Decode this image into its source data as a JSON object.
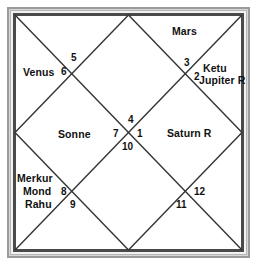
{
  "chart": {
    "type": "north-indian-vedic-chart",
    "title": "",
    "style": {
      "line_color": "#333333",
      "frame_color": "#4a4a4a",
      "background": "#ffffff",
      "text_color": "#111111"
    },
    "houses": [
      {
        "number": "1",
        "position": "center-right",
        "planets": []
      },
      {
        "number": "2",
        "position": "upper-right-inner",
        "planets": [
          "Ketu",
          "Jupiter R"
        ]
      },
      {
        "number": "3",
        "position": "upper-right-corner",
        "planets": []
      },
      {
        "number": "4",
        "position": "center-top",
        "planets": []
      },
      {
        "number": "5",
        "position": "upper-left-corner",
        "planets": []
      },
      {
        "number": "6",
        "position": "upper-left-inner",
        "planets": [
          "Venus"
        ]
      },
      {
        "number": "7",
        "position": "center-left",
        "planets": [
          "Sonne"
        ]
      },
      {
        "number": "8",
        "position": "lower-left-inner",
        "planets": [
          "Merkur",
          "Mond",
          "Rahu"
        ]
      },
      {
        "number": "9",
        "position": "lower-left-corner",
        "planets": []
      },
      {
        "number": "10",
        "position": "center-bottom",
        "planets": []
      },
      {
        "number": "11",
        "position": "lower-right-corner",
        "planets": []
      },
      {
        "number": "12",
        "position": "lower-right-inner",
        "planets": [
          "Saturn R"
        ]
      }
    ],
    "labels": {
      "mars": "Mars",
      "ketu": "Ketu",
      "jupiter": "Jupiter R",
      "venus": "Venus",
      "sonne": "Sonne",
      "saturn": "Saturn R",
      "merkur": "Merkur",
      "mond": "Mond",
      "rahu": "Rahu"
    },
    "numbers": {
      "n1": "1",
      "n2": "2",
      "n3": "3",
      "n4": "4",
      "n5": "5",
      "n6": "6",
      "n7": "7",
      "n8": "8",
      "n9": "9",
      "n10": "10",
      "n11": "11",
      "n12": "12"
    }
  }
}
